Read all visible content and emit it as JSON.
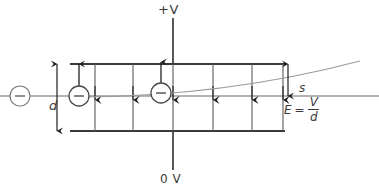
{
  "diagram": {
    "labels": {
      "top_plate_potential": "+V",
      "bottom_plate_potential": "0 V",
      "plate_separation": "d",
      "deflection": "s",
      "field_equation_lhs": "E",
      "field_equation_equals": "=",
      "field_equation_numerator": "V",
      "field_equation_denominator": "d"
    },
    "charges": [
      {
        "name": "electron-entering",
        "sign": "–",
        "cx": 20,
        "cy": 96,
        "r": 10
      },
      {
        "name": "electron-at-plate-edge",
        "sign": "–",
        "cx": 79,
        "cy": 96,
        "r": 10
      },
      {
        "name": "electron-mid-field",
        "sign": "–",
        "cx": 161,
        "cy": 93,
        "r": 10
      }
    ],
    "force_arrows_up": [
      {
        "name": "force-arrow-left",
        "x": 79,
        "y_tail": 93,
        "y_head": 64
      },
      {
        "name": "force-arrow-mid",
        "x": 161,
        "y_tail": 90,
        "y_head": 62
      }
    ],
    "field_lines": [
      {
        "x": 95
      },
      {
        "x": 133
      },
      {
        "x": 173
      },
      {
        "x": 213
      },
      {
        "x": 252
      },
      {
        "x": 283
      }
    ],
    "geometry": {
      "plate_left": 70,
      "plate_right": 285,
      "top_plate_y": 64,
      "bottom_plate_y": 131,
      "axis_y": 96,
      "axis_left": 0,
      "axis_right": 379,
      "supply_line_x": 173,
      "supply_top_y": 18,
      "supply_bottom_y": 170,
      "d_arrow_x": 57,
      "s_arrow_x": 288,
      "s_top_y": 64,
      "s_bottom_y": 96,
      "trajectory": "M 76 97 Q 200 97 360 61"
    },
    "colors": {
      "ink": "#3a3a3a",
      "light_ink": "#8c8c8c",
      "background": "#ffffff"
    }
  }
}
